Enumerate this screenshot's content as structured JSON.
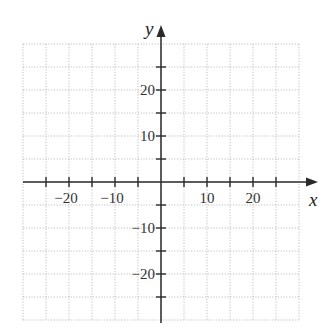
{
  "chart_data": {
    "type": "scatter",
    "title": "",
    "xlabel": "x",
    "ylabel": "y",
    "xlim": [
      -30,
      30
    ],
    "ylim": [
      -30,
      30
    ],
    "grid": true,
    "grid_style": "dotted",
    "grid_spacing": 5,
    "x_ticks": [
      -25,
      -20,
      -15,
      -10,
      -5,
      5,
      10,
      15,
      20,
      25
    ],
    "y_ticks": [
      -25,
      -20,
      -15,
      -10,
      -5,
      5,
      10,
      15,
      20,
      25
    ],
    "x_tick_labels": [
      {
        "value": -20,
        "label": "−20"
      },
      {
        "value": -10,
        "label": "−10"
      },
      {
        "value": 10,
        "label": "10"
      },
      {
        "value": 20,
        "label": "20"
      }
    ],
    "y_tick_labels": [
      {
        "value": 20,
        "label": "20"
      },
      {
        "value": 10,
        "label": "10"
      },
      {
        "value": -10,
        "label": "−10"
      },
      {
        "value": -20,
        "label": "−20"
      }
    ],
    "series": [],
    "colors": {
      "axis": "#2a2a2a",
      "grid": "#b8b8b8",
      "text": "#333333"
    }
  }
}
